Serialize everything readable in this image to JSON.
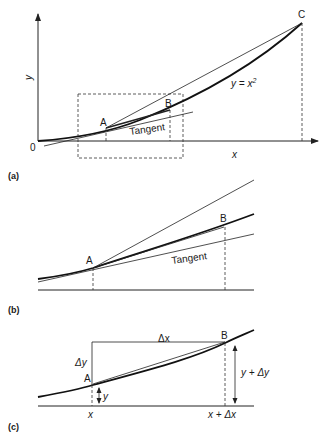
{
  "panels": {
    "a": {
      "label": "(a)",
      "axis_y_label": "y",
      "axis_x_label": "x",
      "origin_label": "0",
      "point_a": "A",
      "point_b": "B",
      "point_c": "C",
      "curve_label": "y = x",
      "curve_label_exp": "2",
      "tangent_label": "Tangent"
    },
    "b": {
      "label": "(b)",
      "point_a": "A",
      "point_b": "B",
      "tangent_label": "Tangent"
    },
    "c": {
      "label": "(c)",
      "point_a": "A",
      "point_b": "B",
      "dx_label": "Δx",
      "dy_label": "Δy",
      "y_label": "y",
      "y_plus_dy_label": "y + Δy",
      "x_label": "x",
      "x_plus_dx_label": "x + Δx"
    }
  }
}
